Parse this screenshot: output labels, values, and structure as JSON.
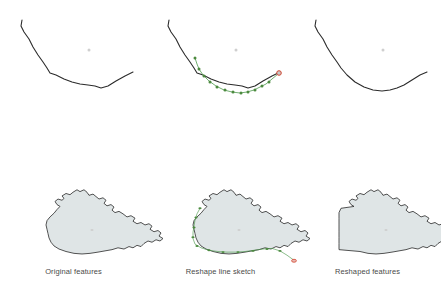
{
  "figure": {
    "columns": [
      {
        "id": "original",
        "caption": "Original features"
      },
      {
        "id": "sketch",
        "caption": "Reshape line sketch"
      },
      {
        "id": "reshaped",
        "caption": "Reshaped features"
      }
    ],
    "rows": [
      {
        "id": "line-feature",
        "label": "Line feature"
      },
      {
        "id": "polygon-feature",
        "label": "Polygon feature"
      }
    ]
  },
  "colors": {
    "background": "#ffffff",
    "feature_outline": "#2b2b2b",
    "polygon_fill": "#dfe5e6",
    "sketch_line": "#4e9a4e",
    "sketch_vertex": "#4c8a3f",
    "sketch_endpoint_fill": "#c9c9c9",
    "sketch_endpoint_stroke": "#d2452f",
    "center_marker": "#cfcfcf",
    "caption_text": "#4a4a4a"
  },
  "geometry": {
    "line_original": "M 22 14 L 21 20 L 24 26 L 29 33 L 33 41 L 38 49 L 43 56 L 47 62 L 50 67 L 56 69 L 64 73 L 72 76 L 80 78 L 88 79 L 95 80 L 101 82 L 108 80 L 116 75 L 125 70 L 133 66",
    "line_reshaped": "M 22 14 L 21 20 L 24 26 L 29 33 L 33 41 L 38 49 L 43 56 L 47 62 L 53 69 L 61 76 L 70 81 L 79 84 L 88 85 L 96 84 L 103 82 L 110 79 L 118 74 L 126 69 L 133 66",
    "sketch_line": "M 48 52 L 50 58 L 52 63 L 56 69 L 62 75 L 69 80 L 77 84 L 85 86 L 93 87 L 100 86 L 107 84 L 113 81 L 119 78 L 125 73 L 131 68",
    "sketch_vertices": [
      [
        48,
        52
      ],
      [
        52,
        63
      ],
      [
        57,
        70
      ],
      [
        63,
        76
      ],
      [
        70,
        81
      ],
      [
        78,
        84
      ],
      [
        86,
        86
      ],
      [
        94,
        87
      ],
      [
        101,
        86
      ],
      [
        108,
        84
      ],
      [
        115,
        80
      ],
      [
        122,
        76
      ]
    ],
    "sketch_endpoint": [
      132,
      67
    ],
    "line_center_marker": [
      89,
      44
    ],
    "polygon_original": "M 60 140 L 57 137 L 55 132 L 58 128 L 62 130 L 64 127 L 62 123 L 66 119 L 70 121 L 73 117 L 77 113 L 80 116 L 84 113 L 87 117 L 89 122 L 93 120 L 96 124 L 99 128 L 103 126 L 106 130 L 104 135 L 107 139 L 111 137 L 114 141 L 112 146 L 115 150 L 119 148 L 123 152 L 127 157 L 131 155 L 135 159 L 133 164 L 137 168 L 141 166 L 145 170 L 149 168 L 152 172 L 150 177 L 154 181 L 158 179 L 161 183 L 159 188 L 163 192 L 160 196 L 156 194 L 152 198 L 148 196 L 144 200 L 141 205 L 137 203 L 133 207 L 129 205 L 124 209 L 118 207 L 112 210 L 105 212 L 98 214 L 90 216 L 82 217 L 74 216 L 66 213 L 59 209 L 54 204 L 51 198 L 49 191 L 48 184 L 47 177 L 46 170 L 47 163 L 50 157 L 54 151 L 57 145 Z",
    "polygon_reshaped": "M 60 140 L 57 137 L 55 132 L 58 128 L 62 130 L 64 127 L 62 123 L 66 119 L 70 121 L 73 117 L 77 113 L 80 116 L 84 113 L 87 117 L 89 122 L 93 120 L 96 124 L 99 128 L 103 126 L 106 130 L 104 135 L 107 139 L 111 137 L 114 141 L 112 146 L 115 150 L 119 148 L 123 152 L 127 157 L 131 155 L 135 159 L 133 164 L 137 168 L 141 166 L 145 170 L 149 168 L 152 172 L 150 177 L 154 181 L 158 179 L 161 183 L 159 188 L 163 192 L 160 196 L 156 194 L 152 198 L 148 196 L 144 200 L 141 205 L 137 203 L 133 207 L 129 205 L 124 209 L 118 207 L 112 210 L 105 212 L 98 214 L 90 216 L 82 217 L 74 216 L 66 213 L 59 212 L 52 211 L 45 210 L 45 200 L 45 190 L 45 180 L 45 170 L 45 160 L 45 150 L 47 143 Z",
    "polygon_sketch_line": "M 53 143 L 50 152 L 48 162 L 47 172 L 46 182 L 46 192 L 48 201 L 54 207 L 62 211 L 71 213 L 80 214 L 89 214 L 98 213 L 107 211 L 116 209 L 125 208 L 133 212 L 140 219 L 146 226",
    "polygon_sketch_vertices": [
      [
        53,
        143
      ],
      [
        49,
        158
      ],
      [
        47,
        174
      ],
      [
        46,
        190
      ],
      [
        50,
        204
      ],
      [
        62,
        211
      ],
      [
        76,
        214
      ],
      [
        91,
        214
      ],
      [
        106,
        212
      ],
      [
        120,
        209
      ],
      [
        133,
        212
      ]
    ],
    "polygon_sketch_endpoint": [
      147,
      228
    ],
    "polygon_center_marker": [
      92,
      178
    ]
  }
}
